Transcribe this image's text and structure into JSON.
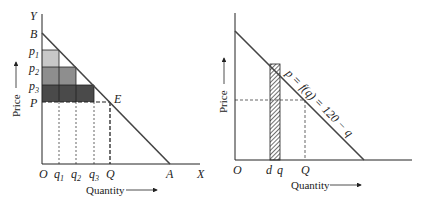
{
  "left": {
    "axis_y": "Y",
    "axis_x": "X",
    "origin": "O",
    "intercept_y": "B",
    "intercept_x": "A",
    "point": "E",
    "prices": [
      {
        "main": "p",
        "sub": "1"
      },
      {
        "main": "p",
        "sub": "2"
      },
      {
        "main": "p",
        "sub": "3"
      },
      {
        "main": "P",
        "sub": ""
      }
    ],
    "quantities": [
      {
        "main": "q",
        "sub": "1"
      },
      {
        "main": "q",
        "sub": "2"
      },
      {
        "main": "q",
        "sub": "3"
      },
      {
        "main": "Q",
        "sub": ""
      }
    ],
    "ylabel": "Price",
    "xlabel": "Quantity",
    "colors": {
      "bar1": "#c8c8c8",
      "bar2": "#8e8e8e",
      "bar3": "#4a4a4a"
    }
  },
  "right": {
    "origin": "O",
    "tick_d": "d",
    "tick_q": "q",
    "tick_Q": "Q",
    "curve_label": "p = f(q) = 120 − q",
    "ylabel": "Price",
    "xlabel": "Quantity"
  }
}
